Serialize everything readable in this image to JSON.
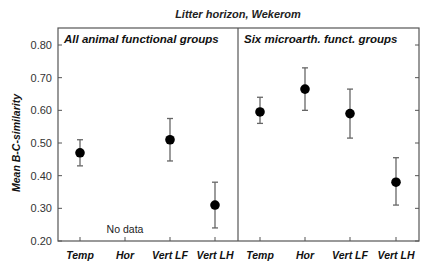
{
  "chart_data": {
    "type": "scatter",
    "subtype": "dot-with-error-bars, two panels",
    "title": "Litter horizon, Wekerom",
    "ylabel": "Mean B-C-similarity",
    "xlabel": "",
    "ylim": [
      0.2,
      0.85
    ],
    "yticks": [
      0.2,
      0.3,
      0.4,
      0.5,
      0.6,
      0.7,
      0.8
    ],
    "ytick_labels": [
      "0.20",
      "0.30",
      "0.40",
      "0.50",
      "0.60",
      "0.70",
      "0.80"
    ],
    "grid": false,
    "legend": null,
    "categories": [
      "Temp",
      "Hor",
      "Vert LF",
      "Vert LH"
    ],
    "panels": [
      {
        "title": "All animal functional groups",
        "annotation": "No data",
        "annotation_category": "Hor",
        "series": [
          {
            "category": "Temp",
            "mean": 0.47,
            "lower": 0.43,
            "upper": 0.51
          },
          {
            "category": "Hor",
            "mean": null,
            "lower": null,
            "upper": null
          },
          {
            "category": "Vert LF",
            "mean": 0.51,
            "lower": 0.445,
            "upper": 0.575
          },
          {
            "category": "Vert LH",
            "mean": 0.31,
            "lower": 0.24,
            "upper": 0.38
          }
        ]
      },
      {
        "title": "Six microarth. funct. groups",
        "annotation": null,
        "series": [
          {
            "category": "Temp",
            "mean": 0.595,
            "lower": 0.56,
            "upper": 0.64
          },
          {
            "category": "Hor",
            "mean": 0.665,
            "lower": 0.6,
            "upper": 0.73
          },
          {
            "category": "Vert LF",
            "mean": 0.59,
            "lower": 0.515,
            "upper": 0.665
          },
          {
            "category": "Vert LH",
            "mean": 0.38,
            "lower": 0.31,
            "upper": 0.455
          }
        ]
      }
    ]
  },
  "colors": {
    "marker": "#000000",
    "errorbar": "#666666",
    "axis": "#555555",
    "background": "#ffffff"
  }
}
